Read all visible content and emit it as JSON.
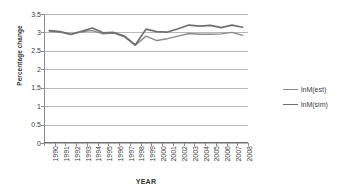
{
  "chart_data": {
    "type": "line",
    "title": "",
    "xlabel": "YEAR",
    "ylabel": "Percentage change",
    "grid": true,
    "legend_position": "right",
    "ylim": [
      0,
      3.5
    ],
    "yticks": [
      "0",
      "0.5",
      "1",
      "1.5",
      "2",
      "2.5",
      "3",
      "3.5"
    ],
    "ytick_values": [
      0,
      0.5,
      1,
      1.5,
      2,
      2.5,
      3,
      3.5
    ],
    "categories": [
      "1990",
      "1991",
      "1992",
      "1993",
      "1994",
      "1995",
      "1996",
      "1997",
      "1998",
      "1999",
      "2000",
      "2001",
      "2002",
      "2003",
      "2004",
      "2005",
      "2006",
      "2007",
      "2008"
    ],
    "series": [
      {
        "name": "lnM(est)",
        "color": "#8a8a8a",
        "values": [
          3.04,
          3.01,
          2.94,
          3.02,
          3.05,
          2.96,
          2.98,
          2.88,
          2.65,
          2.9,
          2.78,
          2.83,
          2.9,
          2.97,
          2.95,
          2.95,
          2.96,
          3.0,
          2.92
        ]
      },
      {
        "name": "lnM(sim)",
        "color": "#6f6f6f",
        "values": [
          3.05,
          3.02,
          2.95,
          3.03,
          3.12,
          2.99,
          3.0,
          2.9,
          2.66,
          3.09,
          3.02,
          3.01,
          3.1,
          3.2,
          3.17,
          3.19,
          3.13,
          3.2,
          3.14
        ]
      }
    ]
  },
  "legend": {
    "items": [
      {
        "label": "lnM(est)"
      },
      {
        "label": "lnM(sim)"
      }
    ]
  }
}
